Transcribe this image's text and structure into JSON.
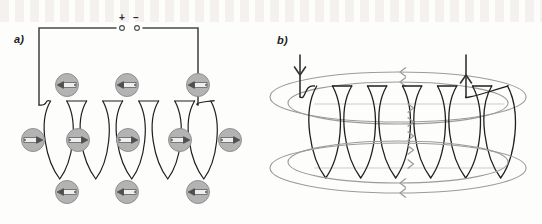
{
  "figure": {
    "width": 542,
    "height": 224,
    "background_color": "#fdfdfc",
    "panels": [
      {
        "id": "a",
        "label": "a)",
        "description": "Solenoid connected to a DC source with compass needles showing the magnetic field direction around the coil",
        "circuit": {
          "terminal_plus_label": "+",
          "terminal_minus_label": "–",
          "wire_color": "#4a4a4a",
          "wire_width": 1.6,
          "terminal_dot_radius": 2.4,
          "loop": {
            "left": 39,
            "right": 198,
            "top": 28,
            "bottom": 105
          },
          "plus_terminal": {
            "x": 122,
            "y": 28
          },
          "minus_terminal": {
            "x": 137,
            "y": 28
          }
        },
        "coil": {
          "color": "#1f1f1f",
          "stroke_width": 1.2,
          "turns": 5,
          "center_y": 140,
          "loop_rx": 13,
          "loop_ry": 39,
          "first_center_x": 56,
          "spacing": 36
        },
        "compasses": {
          "fill": "#b3b3b3",
          "stroke": "#8a8a8a",
          "needle_color": "#4f4f4f",
          "needle_body_color": "#eeeeee",
          "radius": 11.5,
          "rows": [
            {
              "row_name": "above-coil",
              "direction": "left",
              "items": [
                {
                  "x": 67,
                  "y": 85
                },
                {
                  "x": 127,
                  "y": 85
                },
                {
                  "x": 198,
                  "y": 85
                }
              ]
            },
            {
              "row_name": "through-coil",
              "direction": "right",
              "items": [
                {
                  "x": 33,
                  "y": 140
                },
                {
                  "x": 78,
                  "y": 140
                },
                {
                  "x": 128,
                  "y": 140
                },
                {
                  "x": 180,
                  "y": 140
                },
                {
                  "x": 230,
                  "y": 140
                }
              ]
            },
            {
              "row_name": "below-coil",
              "direction": "left",
              "items": [
                {
                  "x": 67,
                  "y": 192
                },
                {
                  "x": 127,
                  "y": 192
                },
                {
                  "x": 198,
                  "y": 192
                }
              ]
            }
          ]
        }
      },
      {
        "id": "b",
        "label": "b)",
        "description": "Solenoid with grey elliptical magnetic field lines looping around the coil; current enters at the left lead and exits at the right lead",
        "coil": {
          "color": "#1f1f1f",
          "stroke_width": 1.3,
          "turns": 6,
          "center_y": 132,
          "loop_rx": 15,
          "loop_ry": 46,
          "first_center_x": 322,
          "spacing": 35
        },
        "leads": {
          "color": "#333333",
          "stroke_width": 1.6,
          "left": {
            "x": 300,
            "y_top": 55,
            "y_bottom": 97,
            "arrow": "down"
          },
          "right": {
            "x": 466,
            "y_top": 55,
            "y_bottom": 97,
            "arrow": "up"
          }
        },
        "field_lines": {
          "color": "#9b9b9b",
          "stroke_width": 1.1,
          "arrow_direction_outside": "left",
          "arrow_direction_inside": "right",
          "ellipses": [
            {
              "cx": 398,
              "cy": 97,
              "rx": 128,
              "ry": 25
            },
            {
              "cx": 398,
              "cy": 103,
              "rx": 110,
              "ry": 21
            },
            {
              "cx": 398,
              "cy": 168,
              "rx": 128,
              "ry": 25
            },
            {
              "cx": 398,
              "cy": 162,
              "rx": 110,
              "ry": 21
            }
          ]
        }
      }
    ]
  }
}
